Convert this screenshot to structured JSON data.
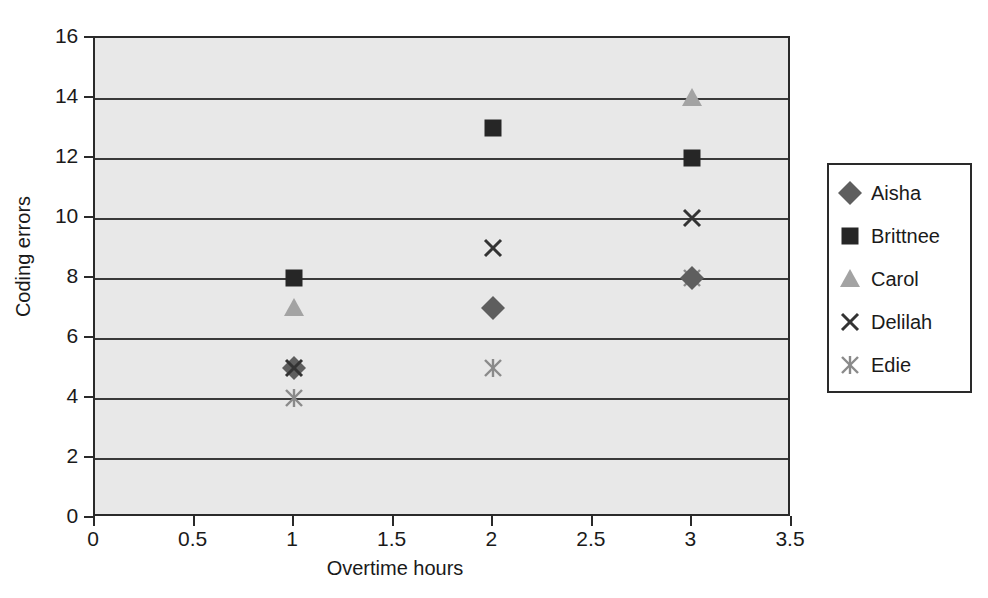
{
  "chart_data": {
    "type": "scatter",
    "title": "",
    "xlabel": "Overtime hours",
    "ylabel": "Coding errors",
    "xlim": [
      0,
      3.5
    ],
    "ylim": [
      0,
      16
    ],
    "xticks": [
      "0",
      "0.5",
      "1",
      "1.5",
      "2",
      "2.5",
      "3",
      "3.5"
    ],
    "xtick_values": [
      0,
      0.5,
      1,
      1.5,
      2,
      2.5,
      3,
      3.5
    ],
    "yticks": [
      "0",
      "2",
      "4",
      "6",
      "8",
      "10",
      "12",
      "14",
      "16"
    ],
    "ytick_values": [
      0,
      2,
      4,
      6,
      8,
      10,
      12,
      14,
      16
    ],
    "grid": "horizontal",
    "legend_position": "right",
    "plot_background": "#e8e8e8",
    "series": [
      {
        "name": "Aisha",
        "marker": "diamond",
        "color": "#5e5e5e",
        "x": [
          1,
          2,
          3
        ],
        "y": [
          5,
          7,
          8
        ]
      },
      {
        "name": "Brittnee",
        "marker": "square",
        "color": "#262626",
        "x": [
          1,
          2,
          3
        ],
        "y": [
          8,
          13,
          12
        ]
      },
      {
        "name": "Carol",
        "marker": "triangle",
        "color": "#a3a3a3",
        "x": [
          1,
          3
        ],
        "y": [
          7,
          14
        ]
      },
      {
        "name": "Delilah",
        "marker": "x",
        "color": "#333333",
        "x": [
          1,
          2,
          3
        ],
        "y": [
          5,
          9,
          10
        ]
      },
      {
        "name": "Edie",
        "marker": "star",
        "color": "#8a8a8a",
        "x": [
          1,
          2,
          3
        ],
        "y": [
          4,
          5,
          8
        ]
      }
    ]
  },
  "caption": {
    "text": ""
  },
  "top_title": {
    "text": ""
  }
}
